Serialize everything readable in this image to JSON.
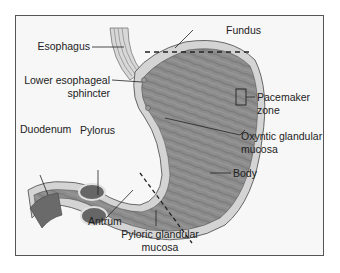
{
  "diagram": {
    "labels": {
      "esophagus": "Esophagus",
      "fundus": "Fundus",
      "les_line1": "Lower esophageal",
      "les_line2": "sphincter",
      "pacemaker_line1": "Pacemaker",
      "pacemaker_line2": "zone",
      "duodenum": "Duodenum",
      "pylorus": "Pylorus",
      "oxyntic_line1": "Oxyntic glandular",
      "oxyntic_line2": "mucosa",
      "body": "Body",
      "antrum": "Antrum",
      "pyloric_line1": "Pyloric glandular",
      "pyloric_line2": "mucosa"
    },
    "colors": {
      "muscle": "#8a8a8a",
      "muscle_dark": "#6a6a6a",
      "wall": "#d6d6d6",
      "frame_bg": "#f7f7f7",
      "border": "#555555"
    }
  }
}
